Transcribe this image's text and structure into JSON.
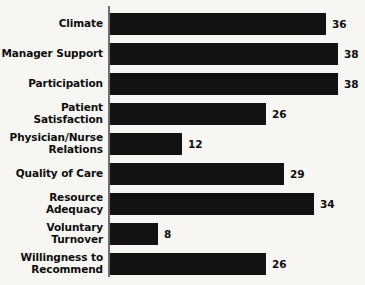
{
  "chart_data": {
    "type": "bar",
    "orientation": "horizontal",
    "title": "",
    "subtitle": "",
    "xlabel": "",
    "ylabel": "",
    "grid": false,
    "legend": null,
    "axis": {
      "category_axis": "vertical-spine",
      "value_axis_visible": false,
      "xlim": [
        0,
        40
      ]
    },
    "categories": [
      "Climate",
      "Manager Support",
      "Participation",
      "Patient Satisfaction",
      "Physician/Nurse\nRelations",
      "Quality of Care",
      "Resource\nAdequacy",
      "Voluntary\nTurnover",
      "Willingness to\nRecommend"
    ],
    "values": [
      36,
      38,
      38,
      26,
      12,
      29,
      34,
      8,
      26
    ],
    "value_labels": [
      "36",
      "38",
      "38",
      "26",
      "12",
      "29",
      "34",
      "8",
      "26"
    ],
    "bars": [
      {
        "label": "Climate",
        "value": 36,
        "value_label": "36"
      },
      {
        "label": "Manager Support",
        "value": 38,
        "value_label": "38"
      },
      {
        "label": "Participation",
        "value": 38,
        "value_label": "38"
      },
      {
        "label": "Patient Satisfaction",
        "value": 26,
        "value_label": "26"
      },
      {
        "label": "Physician/Nurse\nRelations",
        "value": 12,
        "value_label": "12"
      },
      {
        "label": "Quality of Care",
        "value": 29,
        "value_label": "29"
      },
      {
        "label": "Resource\nAdequacy",
        "value": 34,
        "value_label": "34"
      },
      {
        "label": "Voluntary\nTurnover",
        "value": 8,
        "value_label": "8"
      },
      {
        "label": "Willingness to\nRecommend",
        "value": 26,
        "value_label": "26"
      }
    ],
    "colors": {
      "bar": "#121212",
      "background": "#f7f6f3",
      "axis": "#6f6f70",
      "text": "#0d0d0d"
    }
  }
}
